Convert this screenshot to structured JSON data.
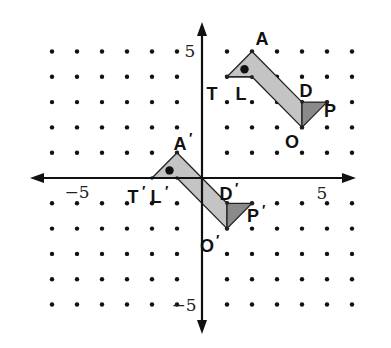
{
  "diagram": {
    "type": "coordinate-plane-translation",
    "grid": {
      "x_min": -6,
      "x_max": 6,
      "y_min": -5,
      "y_max": 5,
      "origin_px": [
        202,
        178
      ],
      "unit_px_x": 25,
      "unit_px_y": 25.3,
      "dot_color": "#111111",
      "dot_radius": 2.2,
      "omit_dots_on_axes": true
    },
    "axes": {
      "x_axis": {
        "from_px": 30,
        "to_px": 356,
        "arrows": "both"
      },
      "y_axis": {
        "from_px": 22,
        "to_px": 334,
        "arrows": "both"
      },
      "color": "#111111",
      "tick_labels": [
        {
          "text": "−5",
          "axis": "x",
          "value": -5,
          "px": [
            77,
            198
          ]
        },
        {
          "text": "5",
          "axis": "x",
          "value": 5,
          "px": [
            322,
            199
          ]
        },
        {
          "text": "5",
          "axis": "y",
          "value": 5,
          "px": [
            190,
            57
          ]
        },
        {
          "text": "−5",
          "axis": "y",
          "value": -5,
          "px": [
            184,
            311
          ]
        }
      ]
    },
    "colors": {
      "body_fill": "#c4c4c4",
      "tail_fill": "#8a8a8a",
      "outline": "#222222",
      "eye": "#111111"
    },
    "figures": [
      {
        "name": "original",
        "vertices": {
          "A": [
            2,
            5
          ],
          "T": [
            1,
            4
          ],
          "L": [
            2,
            4
          ],
          "D": [
            4,
            3
          ],
          "P": [
            5,
            3
          ],
          "O": [
            4,
            2
          ]
        },
        "eye": [
          1.7,
          4.3
        ],
        "labels": [
          {
            "text": "A",
            "prime": false,
            "px": [
              262,
              45
            ]
          },
          {
            "text": "T",
            "prime": false,
            "px": [
              212,
              100
            ]
          },
          {
            "text": "L",
            "prime": false,
            "px": [
              241,
              100
            ]
          },
          {
            "text": "D",
            "prime": false,
            "px": [
              306,
              97
            ]
          },
          {
            "text": "P",
            "prime": false,
            "px": [
              330,
              117
            ]
          },
          {
            "text": "O",
            "prime": false,
            "px": [
              292,
              148
            ]
          }
        ]
      },
      {
        "name": "image",
        "translation": [
          -3,
          -4
        ],
        "vertices": {
          "A": [
            -1,
            1
          ],
          "T": [
            -2,
            0
          ],
          "L": [
            -1,
            0
          ],
          "D": [
            1,
            -1
          ],
          "P": [
            2,
            -1
          ],
          "O": [
            1,
            -2
          ]
        },
        "eye": [
          -1.3,
          0.3
        ],
        "labels": [
          {
            "text": "A",
            "prime": true,
            "px": [
              180,
              150
            ]
          },
          {
            "text": "T",
            "prime": true,
            "px": [
              133,
              203
            ]
          },
          {
            "text": "L",
            "prime": true,
            "px": [
              156,
              203
            ]
          },
          {
            "text": "D",
            "prime": true,
            "px": [
              226,
              200
            ]
          },
          {
            "text": "P",
            "prime": true,
            "px": [
              253,
              222
            ]
          },
          {
            "text": "O",
            "prime": true,
            "px": [
              207,
              252
            ]
          }
        ]
      }
    ]
  }
}
